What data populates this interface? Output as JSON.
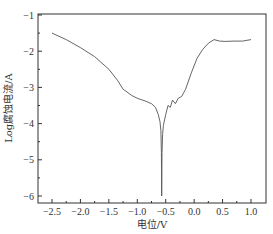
{
  "chart_data": {
    "type": "line",
    "title": "",
    "xlabel": "电位/V",
    "ylabel": "Log腐蚀电流/A",
    "xlim": [
      -2.75,
      1.25
    ],
    "ylim": [
      -6.5,
      -1
    ],
    "xticks": [
      -2.5,
      -2.0,
      -1.5,
      -1.0,
      -0.5,
      0.0,
      0.5,
      1.0
    ],
    "xtick_labels": [
      "-2.5",
      "-2.0",
      "-1.5",
      "-1.0",
      "-0.5",
      "0.0",
      "0.5",
      "1.0"
    ],
    "yticks": [
      -1,
      -2,
      -3,
      -4,
      -5,
      -6
    ],
    "ytick_labels": [
      "-1",
      "-2",
      "-3",
      "-4",
      "-5",
      "-6"
    ],
    "grid": false,
    "legend": null,
    "series": [
      {
        "name": "polarization curve",
        "x": [
          -2.5,
          -2.25,
          -2.0,
          -1.75,
          -1.5,
          -1.35,
          -1.25,
          -1.1,
          -1.0,
          -0.85,
          -0.75,
          -0.68,
          -0.63,
          -0.6,
          -0.585,
          -0.575,
          -0.57,
          -0.565,
          -0.555,
          -0.54,
          -0.5,
          -0.46,
          -0.42,
          -0.38,
          -0.33,
          -0.28,
          -0.22,
          -0.15,
          -0.05,
          0.05,
          0.15,
          0.25,
          0.35,
          0.45,
          0.55,
          0.7,
          0.85,
          1.0
        ],
        "y": [
          -1.5,
          -1.68,
          -1.9,
          -2.15,
          -2.5,
          -2.8,
          -3.05,
          -3.22,
          -3.3,
          -3.38,
          -3.45,
          -3.55,
          -3.75,
          -3.95,
          -4.2,
          -4.8,
          -6.0,
          -4.8,
          -4.3,
          -4.05,
          -3.75,
          -3.5,
          -3.55,
          -3.35,
          -3.45,
          -3.3,
          -3.25,
          -3.05,
          -2.6,
          -2.2,
          -1.95,
          -1.78,
          -1.68,
          -1.72,
          -1.73,
          -1.72,
          -1.72,
          -1.68
        ]
      }
    ]
  },
  "axes": {
    "xlabel": "电位/V",
    "ylabel": "Log腐蚀电流/A",
    "xtick_labels": [
      "-2.5",
      "-2.0",
      "-1.5",
      "-1.0",
      "-0.5",
      "0.0",
      "0.5",
      "1.0"
    ],
    "ytick_labels": [
      "-1",
      "-2",
      "-3",
      "-4",
      "-5",
      "-6"
    ]
  },
  "colors": {
    "line": "#555555",
    "frame": "#333333"
  }
}
